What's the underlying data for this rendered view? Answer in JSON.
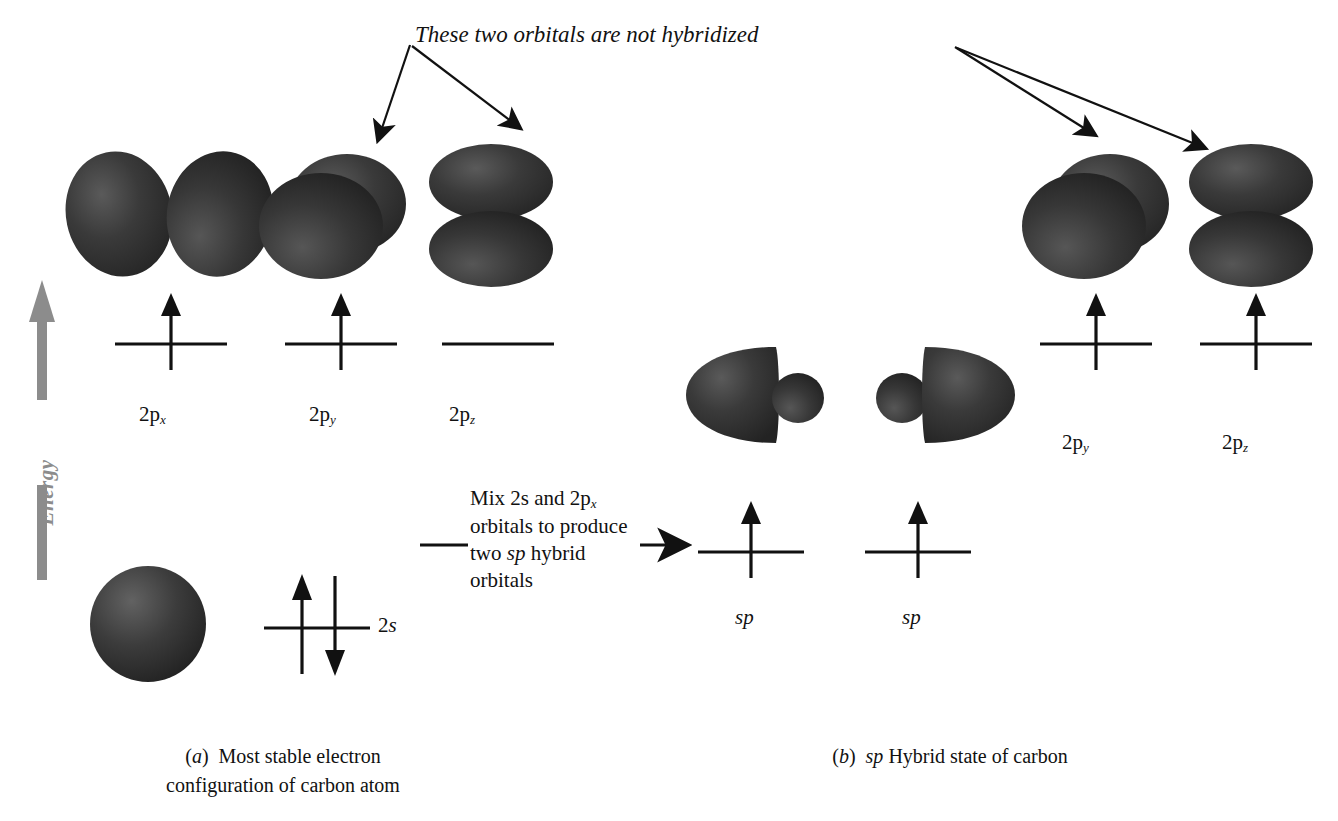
{
  "title_note": "These two orbitals are not hybridized",
  "energy_axis": {
    "label": "Energy",
    "color": "#8c8c8c",
    "direction": "up"
  },
  "left_panel": {
    "caption_line1": "(a)  Most stable electron",
    "caption_line2": "configuration of carbon atom",
    "caption_marker": "a",
    "levels": [
      {
        "name": "2p_x",
        "label_base": "2p",
        "label_sub": "x",
        "electrons": [
          "up"
        ],
        "shape": "two-lobes-horizontal"
      },
      {
        "name": "2p_y",
        "label_base": "2p",
        "label_sub": "y",
        "electrons": [
          "up"
        ],
        "shape": "two-discs-overlapping"
      },
      {
        "name": "2p_z",
        "label_base": "2p",
        "label_sub": "z",
        "electrons": [],
        "shape": "two-lobes-vertical"
      },
      {
        "name": "2s",
        "label_base": "2",
        "label_sub": "s",
        "electrons": [
          "up",
          "down"
        ],
        "shape": "sphere"
      }
    ],
    "s_label": "2s"
  },
  "transition": {
    "line1": "Mix 2s and 2p",
    "line1_sub": "x",
    "line2": "orbitals to produce",
    "line3_a": "two ",
    "line3_i": "sp",
    "line3_b": " hybrid",
    "line4": "orbitals",
    "arrow": "right-arrow"
  },
  "right_panel": {
    "caption_marker": "b",
    "caption_text": "(b)  sp Hybrid state of carbon",
    "caption_pre": "(",
    "caption_mid": ")  ",
    "caption_sp": "sp",
    "caption_post": " Hybrid state of carbon",
    "levels": [
      {
        "name": "sp_1",
        "label": "sp",
        "electrons": [
          "up"
        ],
        "shape": "sp-hybrid-left"
      },
      {
        "name": "sp_2",
        "label": "sp",
        "electrons": [
          "up"
        ],
        "shape": "sp-hybrid-right"
      },
      {
        "name": "2p_y",
        "label_base": "2p",
        "label_sub": "y",
        "electrons": [
          "up"
        ],
        "shape": "two-discs-overlapping"
      },
      {
        "name": "2p_z",
        "label_base": "2p",
        "label_sub": "z",
        "electrons": [
          "up"
        ],
        "shape": "two-lobes-vertical"
      }
    ]
  },
  "colors": {
    "orbital_dark": "#2e2e2e",
    "orbital_mid": "#3d3d3d",
    "line": "#111111",
    "energy_gray": "#8c8c8c"
  }
}
